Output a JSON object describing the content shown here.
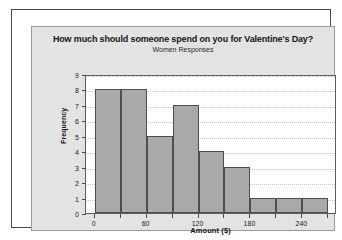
{
  "chart_data": {
    "type": "bar",
    "title": "How much should someone spend on you for Valentine's Day?",
    "subtitle": "Women Responses",
    "xlabel": "Amount ($)",
    "ylabel": "Frequency",
    "xlim": [
      -10,
      280
    ],
    "ylim": [
      0,
      9
    ],
    "grid": true,
    "legend": "none",
    "bin_width": 30,
    "bin_edges": [
      0,
      30,
      60,
      90,
      120,
      150,
      180,
      210,
      240,
      270
    ],
    "categories": [
      "0-30",
      "30-60",
      "60-90",
      "90-120",
      "120-150",
      "150-180",
      "180-210",
      "210-240",
      "240-270"
    ],
    "values": [
      8,
      8,
      5,
      7,
      4,
      3,
      1,
      1,
      1
    ],
    "x_ticks": [
      0,
      60,
      120,
      180,
      240
    ],
    "x_tick_labels": [
      "0",
      "60",
      "120",
      "180",
      "240"
    ],
    "y_ticks": [
      0,
      1,
      2,
      3,
      4,
      5,
      6,
      7,
      8,
      9
    ],
    "y_tick_labels": [
      "0",
      "1",
      "2",
      "3",
      "4",
      "5",
      "6",
      "7",
      "8",
      "9"
    ],
    "bar_color": "#a9a9a9",
    "bar_edge_color": "#4e4e4e",
    "plot_background": "#ffffff",
    "figure_background": "#e3e3e3",
    "gridline_color": "#c9c9c9"
  }
}
